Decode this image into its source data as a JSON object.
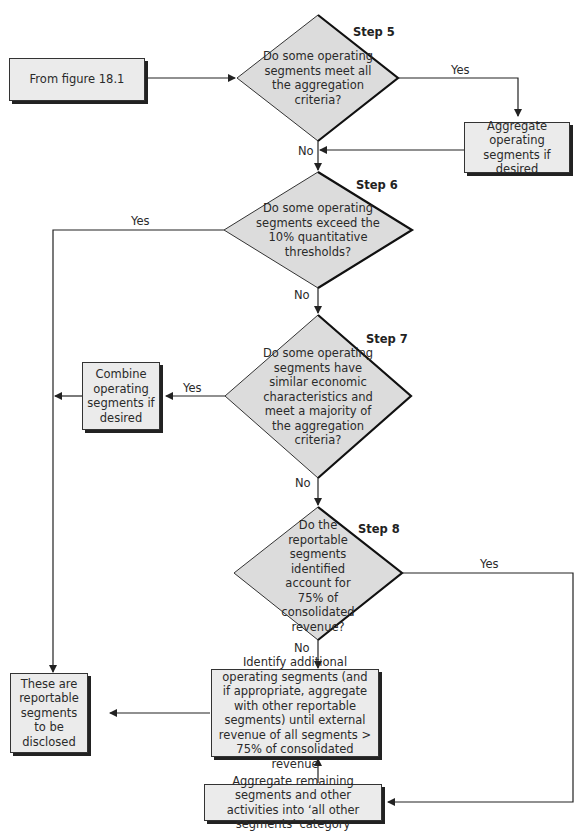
{
  "start": {
    "label": "From figure 18.1"
  },
  "steps": [
    {
      "step_label": "Step 5",
      "question": "Do some operating segments meet all the aggregation criteria?"
    },
    {
      "step_label": "Step 6",
      "question": "Do some operating segments exceed the 10% quantitative thresholds?"
    },
    {
      "step_label": "Step 7",
      "question": "Do some operating segments have similar economic characteristics and meet a majority of the aggregation criteria?"
    },
    {
      "step_label": "Step 8",
      "question": "Do the reportable segments identified account for 75% of consolidated revenue?"
    }
  ],
  "boxes": {
    "aggregate_if_desired": "Aggregate operating segments if desired",
    "combine_if_desired": "Combine operating segments if desired",
    "reportable": "These are reportable segments to be disclosed",
    "identify_additional": "Identify additional operating segments (and if appropriate, aggregate with other reportable segments) until external revenue of all segments > 75% of consolidated revenue",
    "aggregate_remaining": "Aggregate remaining segments and other activities into ‘all other segments’ category"
  },
  "edge_labels": {
    "yes": "Yes",
    "no": "No"
  },
  "colors": {
    "shape_fill": "#ebebeb",
    "line": "#222222",
    "shadow": "#1a1a1a"
  }
}
